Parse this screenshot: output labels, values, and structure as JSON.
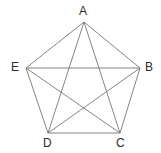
{
  "figure": {
    "name": "complete-graph-k5-pentagon",
    "background_color": "#ffffff",
    "width": 161,
    "height": 153,
    "edge_color": "#767676",
    "edge_width": 0.9,
    "label_color": "#2b2b2b",
    "label_font_size": 12
  },
  "chart_data": {
    "type": "diagram",
    "title": "",
    "subtitle": "",
    "xlabel": "",
    "ylabel": "",
    "graph_name": "K5",
    "vertex_count": 5,
    "edge_count": 10,
    "vertices": [
      {
        "id": "A",
        "label": "A",
        "x": 84,
        "y": 22,
        "label_x": 79,
        "label_y": 5,
        "position": "top"
      },
      {
        "id": "B",
        "label": "B",
        "x": 140,
        "y": 68,
        "label_x": 145,
        "label_y": 61,
        "position": "right"
      },
      {
        "id": "C",
        "label": "C",
        "x": 120,
        "y": 133,
        "label_x": 116,
        "label_y": 137,
        "position": "bottom-right"
      },
      {
        "id": "D",
        "label": "D",
        "x": 48,
        "y": 133,
        "label_x": 43,
        "label_y": 137,
        "position": "bottom-left"
      },
      {
        "id": "E",
        "label": "E",
        "x": 26,
        "y": 68,
        "label_x": 11,
        "label_y": 61,
        "position": "left"
      }
    ],
    "edges": [
      {
        "from": "A",
        "to": "B",
        "kind": "side"
      },
      {
        "from": "B",
        "to": "C",
        "kind": "side"
      },
      {
        "from": "C",
        "to": "D",
        "kind": "side"
      },
      {
        "from": "D",
        "to": "E",
        "kind": "side"
      },
      {
        "from": "E",
        "to": "A",
        "kind": "side"
      },
      {
        "from": "A",
        "to": "C",
        "kind": "diagonal"
      },
      {
        "from": "A",
        "to": "D",
        "kind": "diagonal"
      },
      {
        "from": "B",
        "to": "D",
        "kind": "diagonal"
      },
      {
        "from": "B",
        "to": "E",
        "kind": "diagonal"
      },
      {
        "from": "C",
        "to": "E",
        "kind": "diagonal"
      }
    ]
  }
}
